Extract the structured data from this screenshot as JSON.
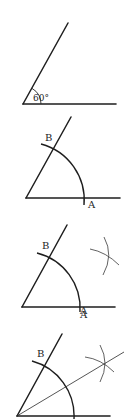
{
  "figure": {
    "colors": {
      "ink": "#1e1e1e",
      "background": "#ffffff"
    },
    "panels": [
      {
        "step": 1,
        "angle_label": "60°",
        "points": {}
      },
      {
        "step": 2,
        "points": {
          "B": "B",
          "A": "A"
        }
      },
      {
        "step": 3,
        "points": {
          "B": "B",
          "A": "A"
        }
      },
      {
        "step": 4,
        "points": {
          "B": "B",
          "A": "A"
        }
      }
    ]
  }
}
